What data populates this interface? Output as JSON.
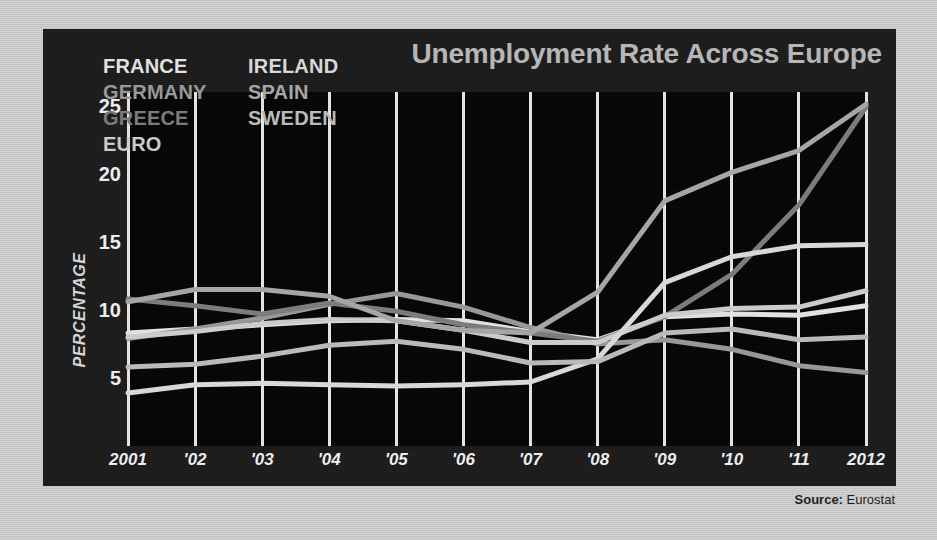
{
  "chart": {
    "title": "Unemployment Rate Across Europe",
    "source_label": "Source:",
    "source_value": "Eurostat"
  },
  "chart_data": {
    "type": "line",
    "title": "Unemployment Rate Across Europe",
    "xlabel": "",
    "ylabel": "PERCENTAGE",
    "grid": "vertical",
    "legend_position": "top-left-inside",
    "xlim": [
      2001,
      2012
    ],
    "ylim": [
      0,
      26
    ],
    "yticks": [
      5,
      10,
      15,
      20,
      25
    ],
    "ytick_labels": [
      "5",
      "10",
      "15",
      "20",
      "25"
    ],
    "x": [
      2001,
      2002,
      2003,
      2004,
      2005,
      2006,
      2007,
      2008,
      2009,
      2010,
      2011,
      2012
    ],
    "xtick_labels": [
      "2001",
      "'02",
      "'03",
      "'04",
      "'05",
      "'06",
      "'07",
      "'08",
      "'09",
      "'10",
      "'11",
      "2012"
    ],
    "series": [
      {
        "name": "FRANCE",
        "color": "#e6e6e6",
        "values": [
          8.3,
          8.6,
          8.9,
          9.2,
          9.3,
          9.2,
          8.4,
          7.8,
          9.5,
          9.7,
          9.6,
          10.3
        ]
      },
      {
        "name": "GERMANY",
        "color": "#9a9a9a",
        "values": [
          7.9,
          8.6,
          9.4,
          10.4,
          11.2,
          10.2,
          8.7,
          7.5,
          7.8,
          7.1,
          5.9,
          5.4
        ]
      },
      {
        "name": "GREECE",
        "color": "#7d7d7d",
        "values": [
          10.8,
          10.3,
          9.7,
          10.5,
          9.9,
          8.9,
          8.3,
          7.7,
          9.5,
          12.6,
          17.7,
          24.9
        ]
      },
      {
        "name": "EURO",
        "color": "#cfcfcf",
        "values": [
          8.0,
          8.4,
          9.0,
          9.3,
          9.2,
          8.5,
          7.6,
          7.6,
          9.6,
          10.1,
          10.2,
          11.4
        ]
      },
      {
        "name": "IRELAND",
        "color": "#dcdcdc",
        "values": [
          3.9,
          4.5,
          4.6,
          4.5,
          4.4,
          4.5,
          4.7,
          6.4,
          12.0,
          13.9,
          14.7,
          14.8
        ]
      },
      {
        "name": "SPAIN",
        "color": "#a8a8a8",
        "values": [
          10.6,
          11.5,
          11.5,
          11.0,
          9.2,
          8.5,
          8.3,
          11.3,
          18.0,
          20.1,
          21.7,
          25.1
        ]
      },
      {
        "name": "SWEDEN",
        "color": "#bdbdbd",
        "values": [
          5.8,
          6.0,
          6.6,
          7.4,
          7.7,
          7.1,
          6.1,
          6.2,
          8.3,
          8.6,
          7.8,
          8.0
        ]
      }
    ]
  },
  "legend": {
    "columns": [
      {
        "items": [
          {
            "label": "FRANCE",
            "color": "#e6e6e6"
          },
          {
            "label": "GERMANY",
            "color": "#9a9a9a"
          },
          {
            "label": "GREECE",
            "color": "#7d7d7d"
          },
          {
            "label": "EURO",
            "color": "#cfcfcf"
          }
        ]
      },
      {
        "items": [
          {
            "label": "IRELAND",
            "color": "#dcdcdc"
          },
          {
            "label": "SPAIN",
            "color": "#a8a8a8"
          },
          {
            "label": "SWEDEN",
            "color": "#bdbdbd"
          }
        ]
      }
    ]
  }
}
